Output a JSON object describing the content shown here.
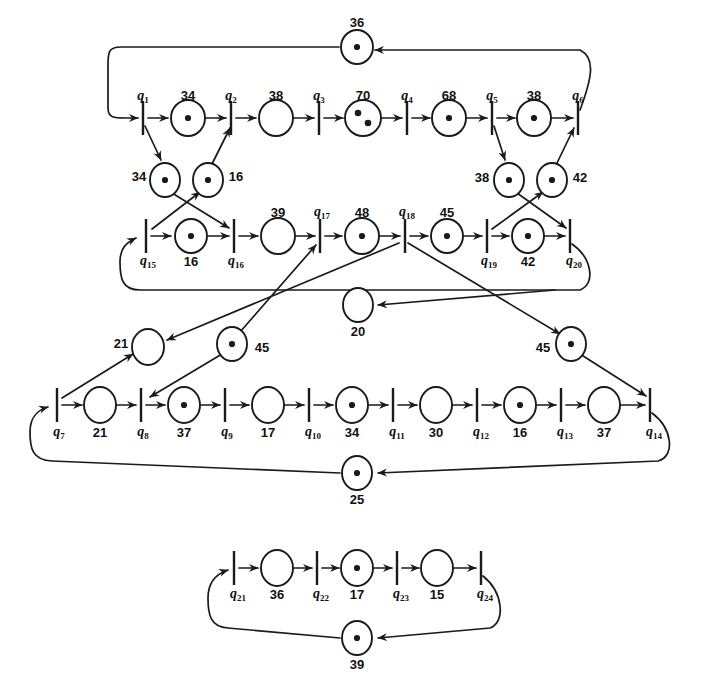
{
  "diagram": {
    "type": "petri-net",
    "stroke_color": "#1a1a1a",
    "fill_color": "#ffffff"
  },
  "places": [
    {
      "id": "p36",
      "label": "36",
      "tokens": 1,
      "cx": 357,
      "cy": 47,
      "rx": 16,
      "ry": 17
    },
    {
      "id": "p34a",
      "label": "34",
      "tokens": 1,
      "cx": 188,
      "cy": 118,
      "rx": 17,
      "ry": 18
    },
    {
      "id": "p38a",
      "label": "38",
      "tokens": 0,
      "cx": 276,
      "cy": 118,
      "rx": 17,
      "ry": 18
    },
    {
      "id": "p70",
      "label": "70",
      "tokens": 2,
      "cx": 363,
      "cy": 118,
      "rx": 18,
      "ry": 18
    },
    {
      "id": "p68",
      "label": "68",
      "tokens": 1,
      "cx": 449,
      "cy": 118,
      "rx": 17,
      "ry": 18
    },
    {
      "id": "p38b",
      "label": "38",
      "tokens": 1,
      "cx": 534,
      "cy": 118,
      "rx": 17,
      "ry": 18
    },
    {
      "id": "p34b",
      "label": "34",
      "tokens": 1,
      "cx": 165,
      "cy": 180,
      "rx": 15,
      "ry": 17
    },
    {
      "id": "p16a",
      "label": "16",
      "tokens": 1,
      "cx": 208,
      "cy": 180,
      "rx": 15,
      "ry": 17
    },
    {
      "id": "p38c",
      "label": "38",
      "tokens": 1,
      "cx": 509,
      "cy": 180,
      "rx": 15,
      "ry": 17
    },
    {
      "id": "p42a",
      "label": "42",
      "tokens": 1,
      "cx": 552,
      "cy": 180,
      "rx": 15,
      "ry": 17
    },
    {
      "id": "p16b",
      "label": "16",
      "tokens": 1,
      "cx": 191,
      "cy": 236,
      "rx": 16,
      "ry": 17
    },
    {
      "id": "p39",
      "label": "39",
      "tokens": 0,
      "cx": 278,
      "cy": 236,
      "rx": 17,
      "ry": 18
    },
    {
      "id": "p48",
      "label": "48",
      "tokens": 1,
      "cx": 362,
      "cy": 236,
      "rx": 17,
      "ry": 18
    },
    {
      "id": "p45a",
      "label": "45",
      "tokens": 1,
      "cx": 447,
      "cy": 236,
      "rx": 16,
      "ry": 17
    },
    {
      "id": "p42b",
      "label": "42",
      "tokens": 1,
      "cx": 528,
      "cy": 236,
      "rx": 16,
      "ry": 17
    },
    {
      "id": "p20",
      "label": "20",
      "tokens": 0,
      "cx": 358,
      "cy": 305,
      "rx": 15,
      "ry": 17
    },
    {
      "id": "p21a",
      "label": "21",
      "tokens": 0,
      "cx": 148,
      "cy": 347,
      "rx": 16,
      "ry": 18
    },
    {
      "id": "p45b",
      "label": "45",
      "tokens": 1,
      "cx": 232,
      "cy": 344,
      "rx": 15,
      "ry": 17
    },
    {
      "id": "p45c",
      "label": "45",
      "tokens": 1,
      "cx": 571,
      "cy": 344,
      "rx": 15,
      "ry": 17
    },
    {
      "id": "p21b",
      "label": "21",
      "tokens": 0,
      "cx": 100,
      "cy": 405,
      "rx": 16,
      "ry": 18
    },
    {
      "id": "p37a",
      "label": "37",
      "tokens": 1,
      "cx": 184,
      "cy": 405,
      "rx": 16,
      "ry": 18
    },
    {
      "id": "p17a",
      "label": "17",
      "tokens": 0,
      "cx": 268,
      "cy": 405,
      "rx": 16,
      "ry": 18
    },
    {
      "id": "p34c",
      "label": "34",
      "tokens": 1,
      "cx": 352,
      "cy": 405,
      "rx": 16,
      "ry": 18
    },
    {
      "id": "p30",
      "label": "30",
      "tokens": 0,
      "cx": 436,
      "cy": 405,
      "rx": 16,
      "ry": 18
    },
    {
      "id": "p16c",
      "label": "16",
      "tokens": 1,
      "cx": 520,
      "cy": 405,
      "rx": 16,
      "ry": 18
    },
    {
      "id": "p37b",
      "label": "37",
      "tokens": 0,
      "cx": 604,
      "cy": 405,
      "rx": 16,
      "ry": 18
    },
    {
      "id": "p25",
      "label": "25",
      "tokens": 1,
      "cx": 357,
      "cy": 473,
      "rx": 15,
      "ry": 17
    },
    {
      "id": "p36b",
      "label": "36",
      "tokens": 0,
      "cx": 277,
      "cy": 568,
      "rx": 16,
      "ry": 18
    },
    {
      "id": "p17b",
      "label": "17",
      "tokens": 1,
      "cx": 357,
      "cy": 568,
      "rx": 16,
      "ry": 18
    },
    {
      "id": "p15",
      "label": "15",
      "tokens": 0,
      "cx": 437,
      "cy": 568,
      "rx": 16,
      "ry": 18
    },
    {
      "id": "p39b",
      "label": "39",
      "tokens": 1,
      "cx": 357,
      "cy": 638,
      "rx": 15,
      "ry": 17
    }
  ],
  "transitions": [
    {
      "id": "q1",
      "label": "q",
      "sub": "1",
      "x": 143,
      "y": 118
    },
    {
      "id": "q2",
      "label": "q",
      "sub": "2",
      "x": 231,
      "y": 118
    },
    {
      "id": "q3",
      "label": "q",
      "sub": "3",
      "x": 319,
      "y": 118
    },
    {
      "id": "q4",
      "label": "q",
      "sub": "4",
      "x": 407,
      "y": 118
    },
    {
      "id": "q5",
      "label": "q",
      "sub": "5",
      "x": 492,
      "y": 118
    },
    {
      "id": "q6",
      "label": "q",
      "sub": "6",
      "x": 578,
      "y": 118
    },
    {
      "id": "q15",
      "label": "q",
      "sub": "15",
      "x": 146,
      "y": 236
    },
    {
      "id": "q16",
      "label": "q",
      "sub": "16",
      "x": 234,
      "y": 236
    },
    {
      "id": "q17",
      "label": "q",
      "sub": "17",
      "x": 320,
      "y": 236
    },
    {
      "id": "q18",
      "label": "q",
      "sub": "18",
      "x": 405,
      "y": 236
    },
    {
      "id": "q19",
      "label": "q",
      "sub": "19",
      "x": 487,
      "y": 236
    },
    {
      "id": "q20",
      "label": "q",
      "sub": "20",
      "x": 570,
      "y": 236
    },
    {
      "id": "q7",
      "label": "q",
      "sub": "7",
      "x": 57,
      "y": 405
    },
    {
      "id": "q8",
      "label": "q",
      "sub": "8",
      "x": 141,
      "y": 405
    },
    {
      "id": "q9",
      "label": "q",
      "sub": "9",
      "x": 225,
      "y": 405
    },
    {
      "id": "q10",
      "label": "q",
      "sub": "10",
      "x": 309,
      "y": 405
    },
    {
      "id": "q11",
      "label": "q",
      "sub": "11",
      "x": 393,
      "y": 405
    },
    {
      "id": "q12",
      "label": "q",
      "sub": "12",
      "x": 477,
      "y": 405
    },
    {
      "id": "q13",
      "label": "q",
      "sub": "13",
      "x": 561,
      "y": 405
    },
    {
      "id": "q14",
      "label": "q",
      "sub": "14",
      "x": 650,
      "y": 405
    },
    {
      "id": "q21",
      "label": "q",
      "sub": "21",
      "x": 234,
      "y": 568
    },
    {
      "id": "q22",
      "label": "q",
      "sub": "22",
      "x": 317,
      "y": 568
    },
    {
      "id": "q23",
      "label": "q",
      "sub": "23",
      "x": 397,
      "y": 568
    },
    {
      "id": "q24",
      "label": "q",
      "sub": "24",
      "x": 481,
      "y": 568
    }
  ],
  "place_label_positions": [
    {
      "id": "p36",
      "x": 357,
      "y": 22
    },
    {
      "id": "p34a",
      "x": 188,
      "y": 95
    },
    {
      "id": "p38a",
      "x": 276,
      "y": 95
    },
    {
      "id": "p70",
      "x": 363,
      "y": 95
    },
    {
      "id": "p68",
      "x": 449,
      "y": 95
    },
    {
      "id": "p38b",
      "x": 534,
      "y": 95
    },
    {
      "id": "p34b",
      "x": 139,
      "y": 176
    },
    {
      "id": "p16a",
      "x": 236,
      "y": 176
    },
    {
      "id": "p38c",
      "x": 482,
      "y": 177
    },
    {
      "id": "p42a",
      "x": 580,
      "y": 177
    },
    {
      "id": "p16b",
      "x": 191,
      "y": 261
    },
    {
      "id": "p39",
      "x": 278,
      "y": 212
    },
    {
      "id": "p48",
      "x": 362,
      "y": 212
    },
    {
      "id": "p45a",
      "x": 447,
      "y": 212
    },
    {
      "id": "p42b",
      "x": 528,
      "y": 261
    },
    {
      "id": "p20",
      "x": 358,
      "y": 331
    },
    {
      "id": "p21a",
      "x": 121,
      "y": 343
    },
    {
      "id": "p45b",
      "x": 262,
      "y": 347
    },
    {
      "id": "p45c",
      "x": 543,
      "y": 347
    },
    {
      "id": "p21b",
      "x": 100,
      "y": 432
    },
    {
      "id": "p37a",
      "x": 184,
      "y": 432
    },
    {
      "id": "p17a",
      "x": 268,
      "y": 432
    },
    {
      "id": "p34c",
      "x": 352,
      "y": 432
    },
    {
      "id": "p30",
      "x": 436,
      "y": 432
    },
    {
      "id": "p16c",
      "x": 520,
      "y": 432
    },
    {
      "id": "p37b",
      "x": 604,
      "y": 432
    },
    {
      "id": "p25",
      "x": 357,
      "y": 499
    },
    {
      "id": "p36b",
      "x": 277,
      "y": 594
    },
    {
      "id": "p17b",
      "x": 357,
      "y": 594
    },
    {
      "id": "p15",
      "x": 437,
      "y": 594
    },
    {
      "id": "p39b",
      "x": 357,
      "y": 664
    }
  ],
  "transition_label_positions": [
    {
      "id": "q1",
      "x": 143,
      "y": 96
    },
    {
      "id": "q2",
      "x": 231,
      "y": 96
    },
    {
      "id": "q3",
      "x": 319,
      "y": 96
    },
    {
      "id": "q4",
      "x": 407,
      "y": 96
    },
    {
      "id": "q5",
      "x": 492,
      "y": 96
    },
    {
      "id": "q6",
      "x": 578,
      "y": 96
    },
    {
      "id": "q15",
      "x": 148,
      "y": 261
    },
    {
      "id": "q16",
      "x": 236,
      "y": 261
    },
    {
      "id": "q17",
      "x": 322,
      "y": 212
    },
    {
      "id": "q18",
      "x": 407,
      "y": 212
    },
    {
      "id": "q19",
      "x": 489,
      "y": 261
    },
    {
      "id": "q20",
      "x": 574,
      "y": 261
    },
    {
      "id": "q7",
      "x": 59,
      "y": 432
    },
    {
      "id": "q8",
      "x": 143,
      "y": 432
    },
    {
      "id": "q9",
      "x": 227,
      "y": 432
    },
    {
      "id": "q10",
      "x": 313,
      "y": 432
    },
    {
      "id": "q11",
      "x": 397,
      "y": 432
    },
    {
      "id": "q12",
      "x": 481,
      "y": 432
    },
    {
      "id": "q13",
      "x": 565,
      "y": 432
    },
    {
      "id": "q14",
      "x": 654,
      "y": 432
    },
    {
      "id": "q21",
      "x": 238,
      "y": 594
    },
    {
      "id": "q22",
      "x": 321,
      "y": 594
    },
    {
      "id": "q23",
      "x": 401,
      "y": 594
    },
    {
      "id": "q24",
      "x": 485,
      "y": 594
    }
  ]
}
